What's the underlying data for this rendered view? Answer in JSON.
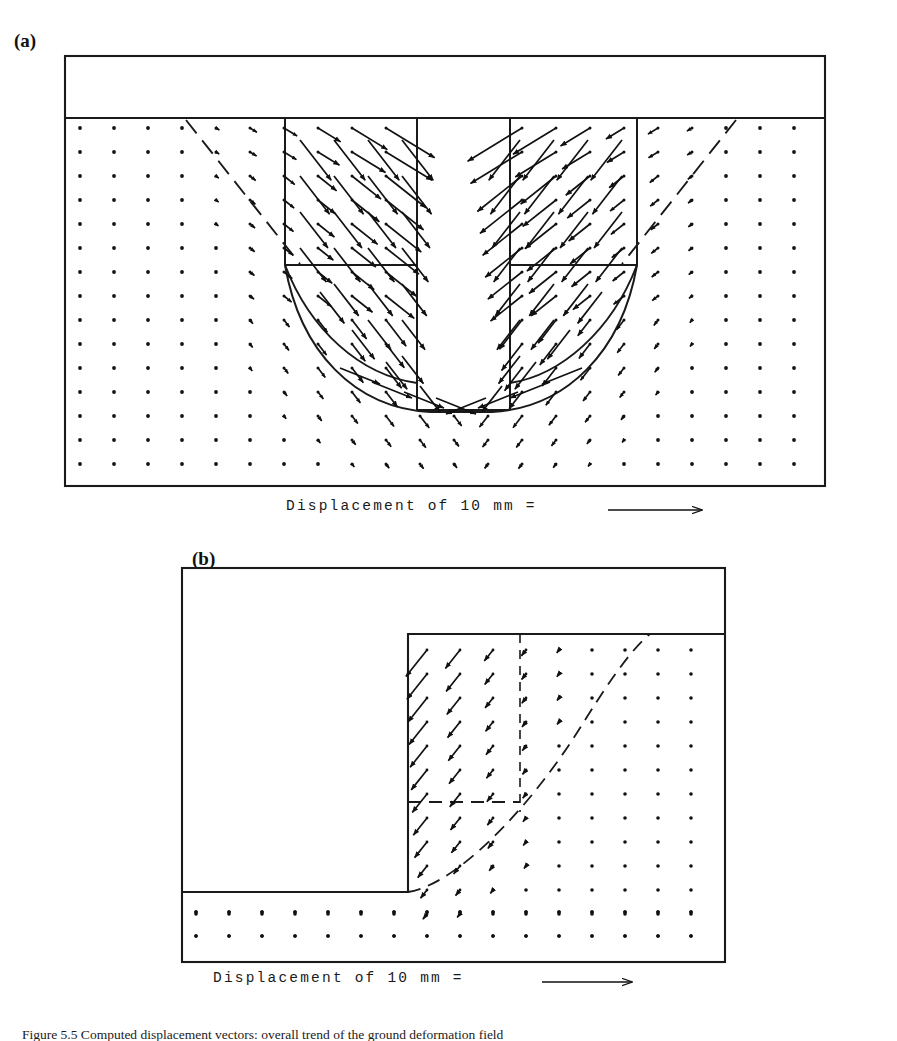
{
  "figure": {
    "caption": "Figure 5.5 Computed displacement vectors: overall trend of the ground deformation field",
    "caption_label": "Figure 5.5",
    "panels": [
      {
        "id": "a",
        "label": "(a)",
        "legend_text": "Displacement of 10 mm =",
        "legend_arrow": "right-arrow",
        "scale_value": 10,
        "scale_unit": "mm",
        "description": "Trench / excavation cross-section with displacement vectors converging into a V-shaped cut"
      },
      {
        "id": "b",
        "label": "(b)",
        "legend_text": "Displacement of 10 mm =",
        "legend_arrow": "right-arrow",
        "scale_value": 10,
        "scale_unit": "mm",
        "description": "Step / half-space cross-section with displacement vectors directed down and to the left"
      }
    ]
  },
  "chart_data": {
    "type": "scatter",
    "title": "",
    "xlabel": "",
    "ylabel": "",
    "subplots": [
      {
        "panel": "a",
        "kind": "vector-field",
        "frame": {
          "x": 65,
          "y": 55,
          "w": 760,
          "h": 432
        },
        "soil_surface_y": 118,
        "grid": {
          "nx": 22,
          "ny": 15,
          "x0": 80,
          "y0": 128,
          "dx": 34,
          "dy": 24
        },
        "scale_arrow_px_per_10mm": 96,
        "annotations": [
          "excavation-outline",
          "failure-surface-dashed",
          "slip-arc-solid"
        ]
      },
      {
        "panel": "b",
        "kind": "vector-field",
        "frame": {
          "x": 180,
          "y": 568,
          "w": 545,
          "h": 394
        },
        "step_top_y": 634,
        "step_x": 408,
        "base_y": 930,
        "grid": {
          "nx": 16,
          "ny": 12,
          "x0": 196,
          "y0": 650,
          "dx": 33,
          "dy": 24
        },
        "scale_arrow_px_per_10mm": 96,
        "annotations": [
          "step-outline",
          "failure-surface-dashed",
          "vertical-dashed-boundary"
        ]
      }
    ]
  },
  "colors": {
    "ink": "#111111",
    "background": "#ffffff",
    "line": "#1a1a1a"
  }
}
